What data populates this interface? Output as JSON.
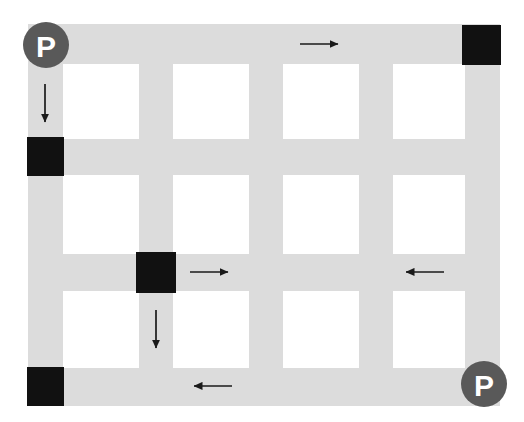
{
  "diagram": {
    "canvas": {
      "width": 524,
      "height": 422,
      "background": "#ffffff"
    },
    "colors": {
      "road": "#dcdcdc",
      "block": "#111111",
      "parking_circle": "#595959",
      "parking_letter": "#ffffff",
      "arrow": "#1a1a1a",
      "background": "#ffffff"
    },
    "roads": {
      "horizontal": [
        {
          "name": "road-h-1",
          "x": 28,
          "y": 24,
          "width": 472,
          "height": 40
        },
        {
          "name": "road-h-2",
          "x": 28,
          "y": 139,
          "width": 472,
          "height": 36
        },
        {
          "name": "road-h-3",
          "x": 28,
          "y": 254,
          "width": 472,
          "height": 37
        },
        {
          "name": "road-h-4",
          "x": 28,
          "y": 368,
          "width": 472,
          "height": 38
        }
      ],
      "vertical": [
        {
          "name": "road-v-1",
          "x": 28,
          "y": 24,
          "width": 35,
          "height": 382
        },
        {
          "name": "road-v-2",
          "x": 139,
          "y": 24,
          "width": 34,
          "height": 382
        },
        {
          "name": "road-v-3",
          "x": 249,
          "y": 24,
          "width": 34,
          "height": 382
        },
        {
          "name": "road-v-4",
          "x": 359,
          "y": 24,
          "width": 34,
          "height": 382
        },
        {
          "name": "road-v-5",
          "x": 465,
          "y": 24,
          "width": 35,
          "height": 382
        }
      ]
    },
    "blocked_intersections": [
      {
        "name": "block-top-right",
        "x": 462,
        "y": 25,
        "width": 39,
        "height": 40,
        "label": ""
      },
      {
        "name": "block-left-upper",
        "x": 27,
        "y": 137,
        "width": 37,
        "height": 39,
        "label": ""
      },
      {
        "name": "block-center",
        "x": 136,
        "y": 252,
        "width": 40,
        "height": 41,
        "label": ""
      },
      {
        "name": "block-bottom-left",
        "x": 27,
        "y": 367,
        "width": 37,
        "height": 39,
        "label": ""
      }
    ],
    "parking_markers": [
      {
        "name": "parking-marker-top-left",
        "label": "P",
        "cx": 46,
        "cy": 45,
        "r": 23
      },
      {
        "name": "parking-marker-bottom-right",
        "label": "P",
        "cx": 484,
        "cy": 384,
        "r": 23
      }
    ],
    "direction_arrows": [
      {
        "name": "arrow-top-east",
        "direction": "east",
        "x1": 300,
        "y1": 44,
        "x2": 338,
        "y2": 44
      },
      {
        "name": "arrow-left-south",
        "direction": "south",
        "x1": 45,
        "y1": 84,
        "x2": 45,
        "y2": 122
      },
      {
        "name": "arrow-mid-east",
        "direction": "east",
        "x1": 190,
        "y1": 272,
        "x2": 228,
        "y2": 272
      },
      {
        "name": "arrow-mid-west",
        "direction": "west",
        "x1": 444,
        "y1": 272,
        "x2": 406,
        "y2": 272
      },
      {
        "name": "arrow-center-south",
        "direction": "south",
        "x1": 156,
        "y1": 310,
        "x2": 156,
        "y2": 348
      },
      {
        "name": "arrow-bottom-west",
        "direction": "west",
        "x1": 232,
        "y1": 386,
        "x2": 194,
        "y2": 386
      }
    ],
    "open_blocks": [
      {
        "name": "city-block-r1c1",
        "x": 63,
        "y": 64,
        "width": 76,
        "height": 75
      },
      {
        "name": "city-block-r1c2",
        "x": 173,
        "y": 64,
        "width": 76,
        "height": 75
      },
      {
        "name": "city-block-r1c3",
        "x": 283,
        "y": 64,
        "width": 76,
        "height": 75
      },
      {
        "name": "city-block-r1c4",
        "x": 393,
        "y": 64,
        "width": 72,
        "height": 75
      },
      {
        "name": "city-block-r2c1",
        "x": 63,
        "y": 175,
        "width": 76,
        "height": 79
      },
      {
        "name": "city-block-r2c2",
        "x": 173,
        "y": 175,
        "width": 76,
        "height": 79
      },
      {
        "name": "city-block-r2c3",
        "x": 283,
        "y": 175,
        "width": 76,
        "height": 79
      },
      {
        "name": "city-block-r2c4",
        "x": 393,
        "y": 175,
        "width": 72,
        "height": 79
      },
      {
        "name": "city-block-r3c1",
        "x": 63,
        "y": 291,
        "width": 76,
        "height": 77
      },
      {
        "name": "city-block-r3c2",
        "x": 173,
        "y": 291,
        "width": 76,
        "height": 77
      },
      {
        "name": "city-block-r3c3",
        "x": 283,
        "y": 291,
        "width": 76,
        "height": 77
      },
      {
        "name": "city-block-r3c4",
        "x": 393,
        "y": 291,
        "width": 72,
        "height": 77
      }
    ]
  }
}
